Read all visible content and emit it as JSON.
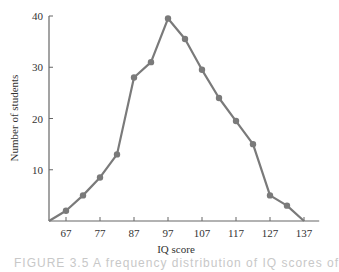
{
  "chart_data": {
    "type": "line",
    "title": "",
    "xlabel": "IQ score",
    "ylabel": "Number of students",
    "x": [
      62,
      67,
      72,
      77,
      82,
      87,
      92,
      97,
      102,
      107,
      112,
      117,
      122,
      127,
      132,
      137
    ],
    "series": [
      {
        "name": "Number of students",
        "values": [
          0,
          2,
          5,
          8.5,
          13,
          28,
          31,
          39.5,
          35.5,
          29.5,
          24,
          19.5,
          15,
          5,
          3,
          0
        ]
      }
    ],
    "xticks": [
      67,
      77,
      87,
      97,
      107,
      117,
      127,
      137
    ],
    "yticks": [
      10,
      20,
      30,
      40
    ],
    "xlim": [
      62,
      140
    ],
    "ylim": [
      0,
      40
    ],
    "grid": false,
    "legend": "none",
    "line_color": "#7a7a7a",
    "marker_color": "#7a7a7a"
  },
  "caption": {
    "text": "FIGURE 3.5  A frequency distribution of IQ scores of"
  }
}
